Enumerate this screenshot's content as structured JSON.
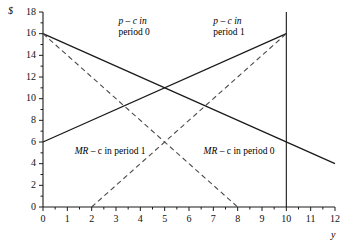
{
  "chart_data": {
    "type": "line",
    "title": "",
    "xlabel": "y",
    "ylabel": "$",
    "xlim": [
      0,
      12
    ],
    "ylim": [
      0,
      18
    ],
    "grid": false,
    "legend_position": "inline-annotations",
    "x_ticks": [
      0,
      1,
      2,
      3,
      4,
      5,
      6,
      7,
      8,
      9,
      10,
      11,
      12
    ],
    "x_tick_labels": [
      "0",
      "1",
      "2",
      "3",
      "4",
      "5",
      "6",
      "7",
      "8",
      "9",
      "10",
      "11",
      "12"
    ],
    "x_minor_ticks": [
      0.5,
      1.5,
      2.5,
      3.5,
      4.5,
      5.5,
      6.5,
      7.5,
      8.5,
      9.5,
      10.5,
      11.5
    ],
    "y_ticks": [
      0,
      2,
      4,
      6,
      8,
      10,
      12,
      14,
      16,
      18
    ],
    "y_tick_labels": [
      "0",
      "2",
      "4",
      "6",
      "8",
      "10",
      "12",
      "14",
      "16",
      "18"
    ],
    "y_minor_ticks": [
      1,
      3,
      5,
      7,
      9,
      11,
      13,
      15,
      17
    ],
    "series": [
      {
        "name": "p - c in period 0",
        "style": "solid",
        "color": "#1a1a1a",
        "points": [
          [
            0,
            16
          ],
          [
            12,
            4
          ]
        ],
        "slope": -1,
        "intercept": 16
      },
      {
        "name": "p - c in period 1",
        "style": "solid",
        "color": "#1a1a1a",
        "points": [
          [
            0,
            6
          ],
          [
            10,
            16
          ]
        ],
        "slope": 1,
        "intercept": 6
      },
      {
        "name": "MR - c in period 0",
        "style": "dashed",
        "color": "#4a4a4a",
        "points": [
          [
            0,
            16
          ],
          [
            8,
            0
          ]
        ],
        "slope": -2,
        "intercept": 16
      },
      {
        "name": "MR - c in period 1",
        "style": "dashed",
        "color": "#4a4a4a",
        "points": [
          [
            2,
            0
          ],
          [
            10,
            16
          ]
        ],
        "slope": 2,
        "intercept": -4
      }
    ],
    "vertical_line": {
      "x": 10,
      "y_from": 0,
      "y_to": 18,
      "style": "solid",
      "color": "#1a1a1a"
    },
    "annotations": [
      {
        "id": "pc0",
        "line1": "p – c in",
        "line2": "period 0",
        "x": 3.1,
        "y": 17.0
      },
      {
        "id": "pc1",
        "line1": "p – c in",
        "line2": "period 1",
        "x": 7.0,
        "y": 17.0
      },
      {
        "id": "mr1",
        "text": "MR – c in period 1",
        "x": 1.3,
        "y": 5.0
      },
      {
        "id": "mr0",
        "text": "MR – c in period 0",
        "x": 6.6,
        "y": 5.0
      }
    ]
  },
  "labels": {
    "y_axis_title": "$",
    "x_axis_title": "y",
    "ann_pc0_line1": "p – c in",
    "ann_pc0_line2": "period 0",
    "ann_pc1_line1": "p – c in",
    "ann_pc1_line2": "period 1",
    "ann_mr1_prefix": "MR",
    "ann_mr1_rest": " – c in period 1",
    "ann_mr0_prefix": "MR",
    "ann_mr0_rest": " – c in period 0"
  }
}
